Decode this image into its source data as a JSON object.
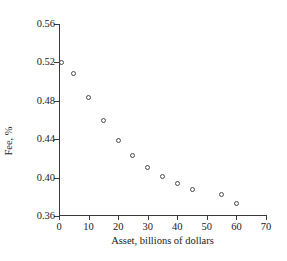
{
  "chart_data": {
    "type": "scatter",
    "title": "",
    "xlabel": "Asset, billions of dollars",
    "ylabel": "Fee, %",
    "xlim": [
      0,
      70
    ],
    "ylim": [
      0.36,
      0.56
    ],
    "xticks": [
      0,
      10,
      20,
      30,
      40,
      50,
      60,
      70
    ],
    "yticks": [
      0.36,
      0.4,
      0.44,
      0.48,
      0.52,
      0.56
    ],
    "xtick_labels": [
      "0",
      "10",
      "20",
      "30",
      "40",
      "50",
      "60",
      "70"
    ],
    "ytick_labels": [
      "0.36",
      "0.40",
      "0.44",
      "0.48",
      "0.52",
      "0.56"
    ],
    "grid": false,
    "legend": null,
    "marker": "open-circle",
    "series": [
      {
        "name": "Fee vs Asset",
        "points": [
          {
            "x": 1,
            "y": 0.52
          },
          {
            "x": 5,
            "y": 0.508
          },
          {
            "x": 10,
            "y": 0.483
          },
          {
            "x": 15,
            "y": 0.46
          },
          {
            "x": 20,
            "y": 0.439
          },
          {
            "x": 25,
            "y": 0.423
          },
          {
            "x": 30,
            "y": 0.411
          },
          {
            "x": 35,
            "y": 0.401
          },
          {
            "x": 40,
            "y": 0.394
          },
          {
            "x": 45,
            "y": 0.388
          },
          {
            "x": 55,
            "y": 0.382
          },
          {
            "x": 60,
            "y": 0.373
          }
        ]
      }
    ]
  },
  "colors": {
    "axis": "#3a3a3a",
    "marker_stroke": "#4a4a52",
    "text": "#1a1a1a",
    "background": "#ffffff"
  }
}
